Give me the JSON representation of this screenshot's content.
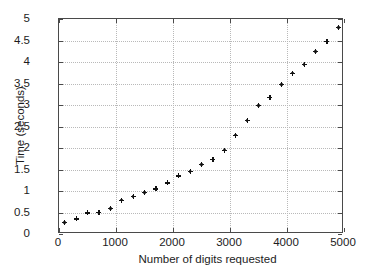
{
  "chart_data": {
    "type": "scatter",
    "title": "",
    "xlabel": "Number of digits requested",
    "ylabel": "Time (seconds)",
    "xlim": [
      0,
      5000
    ],
    "ylim": [
      0,
      5
    ],
    "xticks": [
      0,
      1000,
      2000,
      3000,
      4000,
      5000
    ],
    "xticklabels": [
      "0",
      "1000",
      "2000",
      "3000",
      "4000",
      "5000"
    ],
    "yticks": [
      0,
      0.5,
      1,
      1.5,
      2,
      2.5,
      3,
      3.5,
      4,
      4.5,
      5
    ],
    "yticklabels": [
      "0",
      "0.5",
      "1",
      "1.5",
      "2",
      "2.5",
      "3",
      "3.5",
      "4",
      "4.5",
      "5"
    ],
    "grid": true,
    "grid_style": "dotted",
    "grid_color": "#b9b9b9",
    "legend": null,
    "marker": "asterisk-dot",
    "marker_color": "#111111",
    "series": [
      {
        "name": "time",
        "x": [
          100,
          300,
          500,
          700,
          900,
          1100,
          1300,
          1500,
          1700,
          1900,
          2100,
          2300,
          2500,
          2700,
          2900,
          3100,
          3300,
          3500,
          3700,
          3900,
          4100,
          4300,
          4500,
          4700,
          4900
        ],
        "y": [
          0.27,
          0.35,
          0.49,
          0.5,
          0.59,
          0.79,
          0.87,
          0.96,
          1.05,
          1.19,
          1.35,
          1.45,
          1.61,
          1.74,
          1.95,
          2.3,
          2.64,
          2.99,
          3.17,
          3.47,
          3.74,
          3.94,
          4.25,
          4.48,
          4.8
        ]
      }
    ]
  }
}
